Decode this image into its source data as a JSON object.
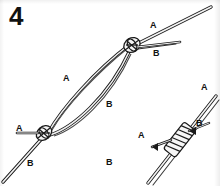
{
  "figure": {
    "kind": "knot-tying-instruction-diagram",
    "step_number": "4",
    "background_color": "#ffffff",
    "ink_color": "#111111",
    "width": 220,
    "height": 186
  },
  "labels": [
    {
      "id": "loop-strand-a",
      "text": "A",
      "x": 63,
      "y": 74
    },
    {
      "id": "loop-strand-b",
      "text": "B",
      "x": 106,
      "y": 100
    },
    {
      "id": "upper-knot-strand-a",
      "text": "A",
      "x": 150,
      "y": 21
    },
    {
      "id": "upper-knot-strand-b",
      "text": "B",
      "x": 153,
      "y": 49
    },
    {
      "id": "lower-knot-strand-a",
      "text": "A",
      "x": 16,
      "y": 124
    },
    {
      "id": "lower-knot-strand-b",
      "text": "B",
      "x": 27,
      "y": 159
    },
    {
      "id": "second-knot-strand-a-tail",
      "text": "A",
      "x": 201,
      "y": 83
    },
    {
      "id": "second-knot-strand-b",
      "text": "B",
      "x": 196,
      "y": 119
    },
    {
      "id": "second-knot-strand-a",
      "text": "A",
      "x": 138,
      "y": 131
    },
    {
      "id": "second-knot-strand-b-tail",
      "text": "B",
      "x": 106,
      "y": 158
    }
  ]
}
